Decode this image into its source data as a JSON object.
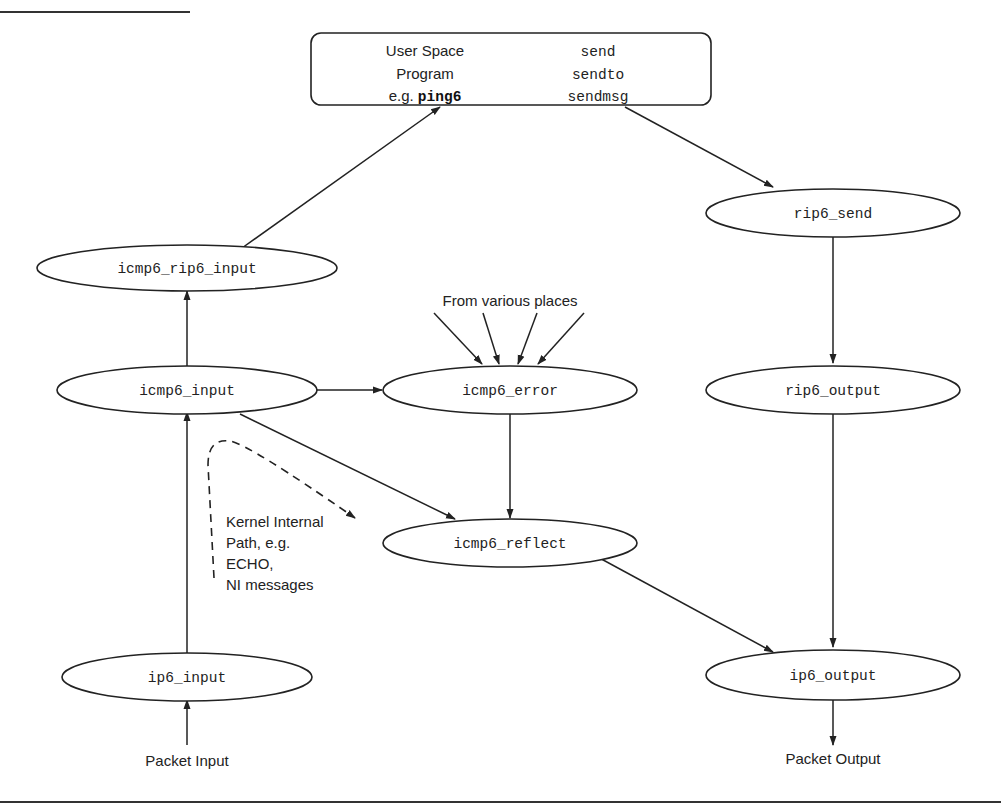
{
  "diagram": {
    "type": "flow",
    "user_program": {
      "left_lines": [
        "User Space",
        "Program",
        "e.g. "
      ],
      "left_bold": "ping6",
      "right_lines": [
        "send",
        "sendto",
        "sendmsg"
      ]
    },
    "nodes": {
      "icmp6_rip6_input": "icmp6_rip6_input",
      "icmp6_input": "icmp6_input",
      "icmp6_error": "icmp6_error",
      "icmp6_reflect": "icmp6_reflect",
      "ip6_input": "ip6_input",
      "rip6_send": "rip6_send",
      "rip6_output": "rip6_output",
      "ip6_output": "ip6_output"
    },
    "labels": {
      "from_various": "From various places",
      "kernel_path": [
        "Kernel Internal",
        "Path, e.g.",
        "ECHO,",
        "NI messages"
      ],
      "packet_input": "Packet Input",
      "packet_output": "Packet Output"
    },
    "edges": [
      {
        "from": "Packet Input",
        "to": "ip6_input"
      },
      {
        "from": "ip6_input",
        "to": "icmp6_input"
      },
      {
        "from": "icmp6_input",
        "to": "icmp6_rip6_input"
      },
      {
        "from": "icmp6_rip6_input",
        "to": "User Space Program"
      },
      {
        "from": "User Space Program",
        "to": "rip6_send"
      },
      {
        "from": "rip6_send",
        "to": "rip6_output"
      },
      {
        "from": "rip6_output",
        "to": "ip6_output"
      },
      {
        "from": "ip6_output",
        "to": "Packet Output"
      },
      {
        "from": "icmp6_input",
        "to": "icmp6_error"
      },
      {
        "from": "icmp6_input",
        "to": "icmp6_reflect"
      },
      {
        "from": "icmp6_error",
        "to": "icmp6_reflect"
      },
      {
        "from": "icmp6_reflect",
        "to": "ip6_output"
      },
      {
        "from": "From various places",
        "to": "icmp6_error",
        "count": 4
      },
      {
        "from": "ip6_input",
        "to": "icmp6_reflect",
        "style": "dashed",
        "label": "Kernel Internal Path, e.g. ECHO, NI messages"
      }
    ]
  }
}
